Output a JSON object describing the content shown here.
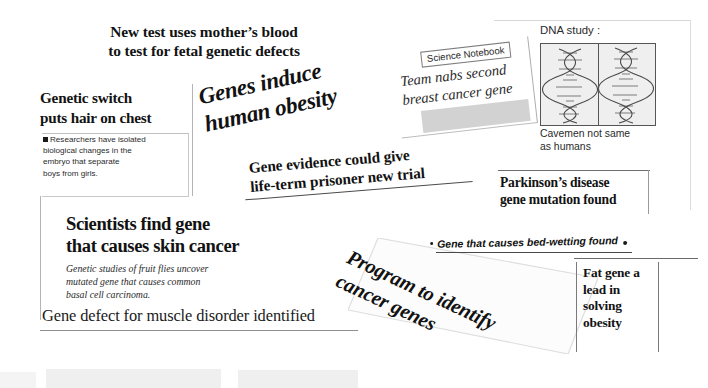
{
  "collage": {
    "title": "Newspaper headline collage about genetics research",
    "background_color": "#ffffff",
    "ink_color": "#121212"
  },
  "headline_fetal": {
    "line1": "New test uses mother’s blood",
    "line2": "to test for fetal genetic defects"
  },
  "clipping_genetic_switch": {
    "headline_line1": "Genetic switch",
    "headline_line2": "puts hair on chest",
    "body_line1": "Researchers have isolated",
    "body_line2": "biological changes in the",
    "body_line3": "embryo that separate",
    "body_line4": "boys from girls.",
    "bullet_icon": "square-bullet-icon"
  },
  "headline_obesity": {
    "line1": "Genes induce",
    "line2": "human obesity",
    "rotation_deg": -12.5
  },
  "clipping_science_notebook": {
    "kicker": "Science Notebook",
    "headline_line1": "Team nabs second",
    "headline_line2": "breast cancer gene",
    "rotation_deg": -6.5
  },
  "panel_dna_study": {
    "label": "DNA study :",
    "caption_line1": "Cavemen not same",
    "caption_line2": "as humans",
    "left_image": "dna-double-helix-icon",
    "right_image": "dna-double-helix-icon"
  },
  "headline_gene_evidence": {
    "line1": "Gene evidence could give",
    "line2": "life-term prisoner new trial",
    "rotation_deg": -4.6
  },
  "clipping_parkinsons": {
    "line1": "Parkinson’s disease",
    "line2": "gene mutation found"
  },
  "clipping_skin_cancer": {
    "headline_line1": "Scientists find gene",
    "headline_line2": "that causes skin cancer",
    "sub_line1": "Genetic studies of fruit flies uncover",
    "sub_line2": "mutated gene that causes common",
    "sub_line3": "basal cell carcinoma."
  },
  "line_bedwetting": {
    "text": "Gene that causes bed-wetting found",
    "bullet_left_icon": "dot-bullet-icon",
    "bullet_right_icon": "dot-bullet-icon"
  },
  "clipping_program": {
    "line1": "Program to identify",
    "line2": "cancer genes",
    "rotation_deg": 25
  },
  "clipping_fat_gene": {
    "line1": "Fat gene a",
    "line2": "lead in",
    "line3": "solving",
    "line4": "obesity"
  },
  "line_gene_defect": {
    "text": "Gene defect for muscle disorder identified"
  }
}
